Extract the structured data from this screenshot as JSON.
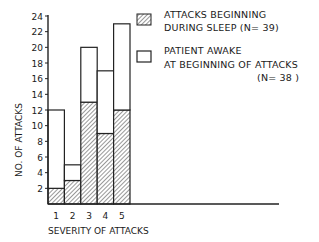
{
  "chart_data": {
    "type": "bar",
    "stacked": true,
    "title": "",
    "xlabel": "SEVERITY OF ATTACKS",
    "ylabel": "NO. OF ATTACKS",
    "categories": [
      "1",
      "2",
      "3",
      "4",
      "5"
    ],
    "series": [
      {
        "name": "ATTACKS BEGINNING DURING SLEEP (N=39)",
        "pattern": "hatched",
        "values": [
          2,
          3,
          13,
          9,
          12
        ]
      },
      {
        "name": "PATIENT AWAKE AT BEGINNING OF ATTACKS (N=38)",
        "pattern": "open",
        "values": [
          10,
          2,
          7,
          8,
          11
        ]
      }
    ],
    "totals": [
      12,
      5,
      20,
      17,
      23
    ],
    "ylim": [
      0,
      24
    ],
    "yticks": [
      2,
      4,
      6,
      8,
      10,
      12,
      14,
      16,
      18,
      20,
      22,
      24
    ],
    "grid": false,
    "legend_position": "upper right"
  },
  "legend": {
    "sleep_line1": "ATTACKS BEGINNING",
    "sleep_line2": "DURING SLEEP (N= 39)",
    "awake_line1": "PATIENT AWAKE",
    "awake_line2": "AT BEGINNING OF ATTACKS",
    "awake_line3": "(N= 38 )"
  },
  "axes": {
    "xlabel": "SEVERITY OF ATTACKS",
    "ylabel": "NO. OF ATTACKS"
  }
}
